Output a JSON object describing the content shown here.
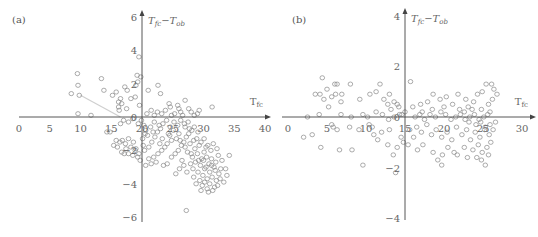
{
  "chart_data": [
    {
      "panel_label": "(a)",
      "type": "scatter",
      "title": "",
      "xlabel": "T_fc",
      "ylabel": "T_fc - T_ob",
      "xlabel_main": "T",
      "xlabel_sub": "fc",
      "ylabel_main_1": "T",
      "ylabel_sub_1": "fc",
      "ylabel_sep": "−",
      "ylabel_main_2": "T",
      "ylabel_sub_2": "ob",
      "x_ticks": [
        0,
        5,
        10,
        15,
        20,
        25,
        30,
        35,
        40
      ],
      "y_ticks": [
        6,
        4,
        2,
        0,
        -2,
        -4,
        -6
      ],
      "xlim": [
        0,
        40
      ],
      "ylim": [
        -6,
        6
      ],
      "grid": false,
      "marker": "open-circle",
      "color": "#888888",
      "trend_line": {
        "x": [
          10,
          16.5
        ],
        "y": [
          1.3,
          0
        ]
      },
      "points": [
        [
          8.5,
          1.4
        ],
        [
          9.5,
          2.6
        ],
        [
          9.6,
          1.9
        ],
        [
          9.8,
          1.3
        ],
        [
          9.6,
          0.2
        ],
        [
          11.7,
          0.1
        ],
        [
          13.4,
          2.3
        ],
        [
          13.8,
          1.6
        ],
        [
          15.8,
          1.5
        ],
        [
          15.2,
          1.3
        ],
        [
          16.2,
          0.9
        ],
        [
          16.5,
          1.1
        ],
        [
          16.2,
          0.6
        ],
        [
          16.7,
          0.8
        ],
        [
          16.3,
          0.4
        ],
        [
          17.2,
          1.8
        ],
        [
          17.6,
          1.6
        ],
        [
          17.5,
          0.5
        ],
        [
          18.2,
          1.1
        ],
        [
          18.9,
          1.2
        ],
        [
          19.2,
          2.5
        ],
        [
          19.3,
          2.1
        ],
        [
          19.0,
          1.9
        ],
        [
          19.5,
          3.6
        ],
        [
          19.6,
          0.7
        ],
        [
          19.8,
          2.4
        ],
        [
          21.0,
          1.6
        ],
        [
          22.6,
          1.9
        ],
        [
          23.0,
          1.4
        ],
        [
          24.4,
          0.8
        ],
        [
          24.6,
          0.6
        ],
        [
          25.8,
          0.7
        ],
        [
          26.0,
          0.5
        ],
        [
          26.3,
          0.3
        ],
        [
          26.6,
          0.1
        ],
        [
          27.0,
          1.0
        ],
        [
          27.6,
          0.5
        ],
        [
          29.0,
          0.2
        ],
        [
          29.3,
          0.4
        ],
        [
          31.4,
          0.6
        ],
        [
          20.8,
          0.2
        ],
        [
          21.5,
          0.4
        ],
        [
          22.0,
          0.1
        ],
        [
          22.5,
          0.3
        ],
        [
          23.2,
          0.2
        ],
        [
          23.8,
          0.4
        ],
        [
          24.8,
          0.1
        ],
        [
          25.3,
          0.2
        ],
        [
          28.0,
          0.3
        ],
        [
          28.5,
          0.1
        ],
        [
          14.3,
          -0.9
        ],
        [
          14.8,
          -0.9
        ],
        [
          15.8,
          -1.4
        ],
        [
          16.4,
          -1.5
        ],
        [
          16.8,
          -1.4
        ],
        [
          17.3,
          -1.6
        ],
        [
          17.8,
          -1.3
        ],
        [
          18.2,
          -1.8
        ],
        [
          18.6,
          -1.5
        ],
        [
          19.0,
          -1.9
        ],
        [
          17.1,
          -2.2
        ],
        [
          17.8,
          -2.2
        ],
        [
          18.5,
          -2.3
        ],
        [
          19.3,
          -2.4
        ],
        [
          19.7,
          -2.6
        ],
        [
          18.9,
          -2.0
        ],
        [
          16.7,
          -2.1
        ],
        [
          17.4,
          -1.9
        ],
        [
          15.4,
          -1.7
        ],
        [
          16.0,
          -1.8
        ],
        [
          16.5,
          -0.4
        ],
        [
          17.0,
          -0.2
        ],
        [
          17.8,
          -0.3
        ],
        [
          18.5,
          -0.1
        ],
        [
          19.4,
          -0.4
        ],
        [
          19.9,
          -0.2
        ],
        [
          20.3,
          -0.5
        ],
        [
          20.6,
          -0.8
        ],
        [
          20.9,
          -1.1
        ],
        [
          21.4,
          -0.6
        ],
        [
          20.1,
          -1.3
        ],
        [
          20.2,
          -1.7
        ],
        [
          20.4,
          -2.0
        ],
        [
          21.1,
          -1.8
        ],
        [
          21.6,
          -1.5
        ],
        [
          22.1,
          -1.2
        ],
        [
          22.5,
          -0.9
        ],
        [
          22.9,
          -1.6
        ],
        [
          23.3,
          -1.3
        ],
        [
          23.7,
          -1.8
        ],
        [
          21.1,
          -2.5
        ],
        [
          21.9,
          -2.4
        ],
        [
          22.6,
          -2.2
        ],
        [
          23.2,
          -2.0
        ],
        [
          24.1,
          -1.6
        ],
        [
          24.5,
          -1.1
        ],
        [
          24.8,
          -1.4
        ],
        [
          25.1,
          -0.8
        ],
        [
          25.6,
          -1.3
        ],
        [
          26.0,
          -1.0
        ],
        [
          24.8,
          -2.4
        ],
        [
          25.4,
          -2.2
        ],
        [
          25.9,
          -2.0
        ],
        [
          26.4,
          -1.7
        ],
        [
          26.8,
          -1.5
        ],
        [
          27.2,
          -1.2
        ],
        [
          27.6,
          -1.0
        ],
        [
          28.1,
          -0.8
        ],
        [
          28.5,
          -0.6
        ],
        [
          29.1,
          -0.9
        ],
        [
          22.0,
          -0.3
        ],
        [
          22.8,
          -0.5
        ],
        [
          23.4,
          -0.4
        ],
        [
          24.0,
          -0.2
        ],
        [
          24.6,
          -0.6
        ],
        [
          25.2,
          -0.3
        ],
        [
          25.8,
          -0.5
        ],
        [
          26.3,
          -0.2
        ],
        [
          26.9,
          -0.4
        ],
        [
          27.5,
          -0.3
        ],
        [
          27.0,
          -1.8
        ],
        [
          27.4,
          -2.1
        ],
        [
          27.8,
          -1.6
        ],
        [
          28.2,
          -2.4
        ],
        [
          28.6,
          -1.9
        ],
        [
          29.0,
          -2.2
        ],
        [
          29.3,
          -1.7
        ],
        [
          29.7,
          -2.5
        ],
        [
          30.1,
          -2.1
        ],
        [
          30.4,
          -1.8
        ],
        [
          27.9,
          -2.8
        ],
        [
          28.3,
          -3.1
        ],
        [
          28.7,
          -2.7
        ],
        [
          29.1,
          -3.3
        ],
        [
          29.5,
          -2.9
        ],
        [
          29.9,
          -3.5
        ],
        [
          30.2,
          -3.1
        ],
        [
          30.6,
          -3.7
        ],
        [
          31.0,
          -3.3
        ],
        [
          31.3,
          -2.9
        ],
        [
          29.4,
          -3.8
        ],
        [
          29.8,
          -4.1
        ],
        [
          30.2,
          -3.9
        ],
        [
          30.6,
          -4.3
        ],
        [
          31.0,
          -4.0
        ],
        [
          31.4,
          -3.6
        ],
        [
          31.8,
          -4.2
        ],
        [
          32.1,
          -3.8
        ],
        [
          32.5,
          -3.4
        ],
        [
          32.8,
          -3.1
        ],
        [
          30.0,
          -2.6
        ],
        [
          30.5,
          -2.4
        ],
        [
          30.9,
          -2.8
        ],
        [
          31.3,
          -2.5
        ],
        [
          31.7,
          -3.0
        ],
        [
          32.0,
          -2.7
        ],
        [
          32.4,
          -2.3
        ],
        [
          33.0,
          -2.6
        ],
        [
          33.6,
          -3.1
        ],
        [
          34.2,
          -2.3
        ],
        [
          29.6,
          -1.5
        ],
        [
          30.1,
          -1.3
        ],
        [
          30.7,
          -1.7
        ],
        [
          31.2,
          -2.0
        ],
        [
          31.6,
          -1.6
        ],
        [
          32.2,
          -1.9
        ],
        [
          28.9,
          -1.3
        ],
        [
          28.4,
          -1.4
        ],
        [
          27.7,
          -0.7
        ],
        [
          26.5,
          -2.6
        ],
        [
          30.8,
          -4.5
        ],
        [
          31.5,
          -4.4
        ],
        [
          32.3,
          -4.1
        ],
        [
          32.7,
          -3.7
        ],
        [
          33.3,
          -3.9
        ],
        [
          33.8,
          -3.5
        ],
        [
          31.9,
          -3.2
        ],
        [
          30.4,
          -3.0
        ],
        [
          29.2,
          -2.6
        ],
        [
          28.0,
          -2.2
        ],
        [
          26.1,
          -3.1
        ],
        [
          25.5,
          -3.4
        ],
        [
          26.8,
          -2.9
        ],
        [
          27.3,
          -3.3
        ],
        [
          28.4,
          -3.6
        ],
        [
          28.8,
          -4.0
        ],
        [
          29.6,
          -4.4
        ],
        [
          27.2,
          -5.6
        ],
        [
          24.1,
          -2.8
        ],
        [
          23.5,
          -2.9
        ],
        [
          20.6,
          -2.9
        ],
        [
          21.5,
          -2.8
        ],
        [
          22.3,
          -2.7
        ],
        [
          19.5,
          -2.2
        ],
        [
          20.5,
          -1.0
        ],
        [
          21.8,
          -0.9
        ],
        [
          23.0,
          -0.7
        ],
        [
          24.3,
          -1.0
        ],
        [
          26.2,
          -1.4
        ],
        [
          27.0,
          -0.6
        ]
      ]
    },
    {
      "panel_label": "(b)",
      "type": "scatter",
      "title": "",
      "xlabel": "T_fc",
      "ylabel": "T_fc - T_ob",
      "xlabel_main": "T",
      "xlabel_sub": "fc",
      "ylabel_main_1": "T",
      "ylabel_sub_1": "fc",
      "ylabel_sep": "−",
      "ylabel_main_2": "T",
      "ylabel_sub_2": "ob",
      "x_ticks": [
        0,
        5,
        10,
        15,
        20,
        25,
        30
      ],
      "y_ticks": [
        4,
        2,
        0,
        -2,
        -4
      ],
      "xlim": [
        0,
        30
      ],
      "ylim": [
        -4,
        4
      ],
      "grid": false,
      "marker": "open-circle",
      "color": "#888888",
      "points": [
        [
          4.4,
          1.55
        ],
        [
          3.5,
          0.9
        ],
        [
          4.1,
          0.9
        ],
        [
          4.6,
          0.7
        ],
        [
          5.0,
          1.1
        ],
        [
          5.6,
          0.8
        ],
        [
          5.2,
          0.4
        ],
        [
          6.0,
          1.3
        ],
        [
          6.3,
          1.3
        ],
        [
          6.1,
          0.9
        ],
        [
          6.8,
          0.6
        ],
        [
          6.9,
          0.9
        ],
        [
          8.0,
          1.3
        ],
        [
          9.2,
          0.7
        ],
        [
          10.5,
          0.9
        ],
        [
          11.3,
          1.0
        ],
        [
          11.8,
          1.3
        ],
        [
          12.3,
          0.7
        ],
        [
          12.8,
          0.5
        ],
        [
          13.0,
          0.9
        ],
        [
          13.2,
          0.3
        ],
        [
          13.6,
          0.6
        ],
        [
          14.0,
          0.5
        ],
        [
          14.2,
          0.4
        ],
        [
          15.0,
          0.2
        ],
        [
          14.6,
          0.1
        ],
        [
          2.5,
          0.0
        ],
        [
          4.0,
          0.1
        ],
        [
          6.8,
          0.1
        ],
        [
          8.1,
          0.0
        ],
        [
          9.6,
          0.1
        ],
        [
          10.2,
          0.0
        ],
        [
          11.3,
          0.2
        ],
        [
          12.1,
          0.1
        ],
        [
          12.9,
          -0.1
        ],
        [
          13.6,
          0.0
        ],
        [
          14.3,
          0.1
        ],
        [
          3.1,
          -0.7
        ],
        [
          4.2,
          -1.2
        ],
        [
          5.8,
          -0.4
        ],
        [
          6.6,
          -1.3
        ],
        [
          8.2,
          -1.3
        ],
        [
          9.6,
          -1.9
        ],
        [
          12.0,
          -0.6
        ],
        [
          12.8,
          -1.1
        ],
        [
          13.5,
          -1.5
        ],
        [
          14.0,
          -1.2
        ],
        [
          14.5,
          -0.8
        ],
        [
          11.5,
          -0.9
        ],
        [
          10.8,
          -0.4
        ],
        [
          5.6,
          -0.3
        ],
        [
          6.3,
          -0.5
        ],
        [
          7.9,
          -0.4
        ],
        [
          9.1,
          -0.5
        ],
        [
          10.4,
          -0.3
        ],
        [
          11.0,
          -0.7
        ],
        [
          13.0,
          -0.5
        ],
        [
          14.8,
          -1.0
        ],
        [
          2.0,
          -0.8
        ],
        [
          13.8,
          -2.2
        ],
        [
          15.7,
          1.4
        ],
        [
          16.0,
          0.4
        ],
        [
          17.2,
          0.2
        ],
        [
          17.9,
          0.6
        ],
        [
          18.6,
          0.9
        ],
        [
          19.5,
          0.7
        ],
        [
          20.3,
          0.8
        ],
        [
          21.1,
          0.5
        ],
        [
          22.0,
          0.3
        ],
        [
          22.6,
          0.2
        ],
        [
          23.1,
          0.4
        ],
        [
          23.8,
          0.6
        ],
        [
          24.3,
          0.9
        ],
        [
          24.9,
          1.0
        ],
        [
          25.4,
          1.3
        ],
        [
          26.1,
          1.3
        ],
        [
          26.4,
          1.1
        ],
        [
          26.2,
          0.7
        ],
        [
          25.7,
          0.5
        ],
        [
          26.8,
          0.9
        ],
        [
          16.3,
          0.0
        ],
        [
          16.9,
          0.1
        ],
        [
          17.5,
          -0.1
        ],
        [
          18.2,
          0.1
        ],
        [
          18.9,
          0.0
        ],
        [
          19.6,
          0.2
        ],
        [
          20.2,
          0.1
        ],
        [
          20.9,
          -0.1
        ],
        [
          21.5,
          0.0
        ],
        [
          22.1,
          0.1
        ],
        [
          22.7,
          -0.1
        ],
        [
          23.3,
          0.0
        ],
        [
          23.9,
          0.1
        ],
        [
          24.5,
          -0.1
        ],
        [
          25.1,
          0.0
        ],
        [
          25.6,
          0.1
        ],
        [
          16.5,
          -0.4
        ],
        [
          17.1,
          -0.6
        ],
        [
          17.8,
          -0.3
        ],
        [
          18.4,
          -0.7
        ],
        [
          19.0,
          -0.5
        ],
        [
          19.7,
          -0.8
        ],
        [
          20.4,
          -0.6
        ],
        [
          21.0,
          -0.9
        ],
        [
          21.6,
          -0.4
        ],
        [
          22.3,
          -0.7
        ],
        [
          22.9,
          -0.5
        ],
        [
          23.4,
          -0.9
        ],
        [
          24.0,
          -0.6
        ],
        [
          24.6,
          -0.8
        ],
        [
          25.2,
          -0.5
        ],
        [
          25.8,
          -0.7
        ],
        [
          26.0,
          -1.0
        ],
        [
          25.5,
          -1.2
        ],
        [
          24.9,
          -1.4
        ],
        [
          24.4,
          -1.1
        ],
        [
          23.7,
          -1.3
        ],
        [
          22.6,
          -1.2
        ],
        [
          21.3,
          -1.4
        ],
        [
          20.5,
          -1.2
        ],
        [
          19.8,
          -1.5
        ],
        [
          19.2,
          -1.7
        ],
        [
          18.6,
          -1.4
        ],
        [
          17.3,
          -1.1
        ],
        [
          16.6,
          -1.3
        ],
        [
          15.4,
          -1.1
        ],
        [
          19.7,
          -1.9
        ],
        [
          21.7,
          -1.5
        ],
        [
          24.8,
          -1.7
        ],
        [
          25.3,
          -1.9
        ],
        [
          23.2,
          -0.2
        ],
        [
          24.1,
          -0.3
        ],
        [
          24.7,
          -0.2
        ],
        [
          25.3,
          -0.4
        ],
        [
          25.9,
          -0.3
        ],
        [
          26.3,
          -0.5
        ],
        [
          26.6,
          -0.2
        ],
        [
          23.6,
          0.3
        ],
        [
          24.8,
          0.3
        ],
        [
          25.9,
          0.2
        ],
        [
          20.0,
          0.4
        ],
        [
          18.5,
          0.3
        ],
        [
          17.0,
          0.5
        ],
        [
          21.8,
          0.9
        ],
        [
          22.8,
          0.7
        ],
        [
          15.6,
          -0.5
        ],
        [
          16.1,
          -0.8
        ],
        [
          24.2,
          -1.6
        ],
        [
          25.7,
          -1.5
        ],
        [
          23.0,
          -1.6
        ]
      ]
    }
  ]
}
